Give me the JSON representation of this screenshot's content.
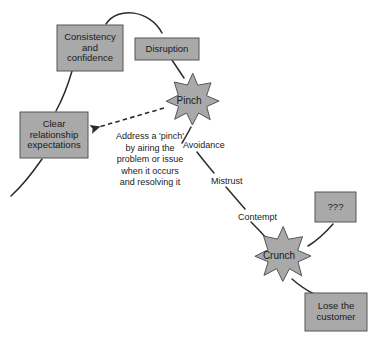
{
  "diagram": {
    "colors": {
      "node_fill": "#a9a9a9",
      "node_stroke": "#555555",
      "line": "#2b2b2b",
      "text": "#1a1a1a",
      "background": "#ffffff"
    },
    "boxes": [
      {
        "id": "consistency",
        "label": "Consistency\nand\nconfidence",
        "x": 57,
        "y": 25,
        "w": 66,
        "h": 46
      },
      {
        "id": "disruption",
        "label": "Disruption",
        "x": 135,
        "y": 38,
        "w": 64,
        "h": 22
      },
      {
        "id": "clear_expectations",
        "label": "Clear\nrelationship\nexpectations",
        "x": 20,
        "y": 112,
        "w": 68,
        "h": 46
      },
      {
        "id": "unknown",
        "label": "???",
        "x": 315,
        "y": 192,
        "w": 41,
        "h": 30
      },
      {
        "id": "lose_customer",
        "label": "Lose the\ncustomer",
        "x": 305,
        "y": 293,
        "w": 62,
        "h": 38
      }
    ],
    "stars": [
      {
        "id": "pinch",
        "label": "Pinch",
        "cx": 189,
        "cy": 101,
        "r_outer": 30,
        "r_inner": 19,
        "points": 11
      },
      {
        "id": "crunch",
        "label": "Crunch",
        "cx": 279,
        "cy": 256,
        "r_outer": 32,
        "r_inner": 20,
        "points": 11
      }
    ],
    "edge_labels": [
      {
        "id": "avoidance",
        "text": "Avoidance",
        "x": 183,
        "y": 140
      },
      {
        "id": "mistrust",
        "text": "Mistrust",
        "x": 211,
        "y": 176
      },
      {
        "id": "contempt",
        "text": "Contempt",
        "x": 238,
        "y": 212
      }
    ],
    "note": {
      "id": "pinch-advice",
      "text": "Address a 'pinch'\nby airing the\nproblem or issue\nwhen it occurs\nand resolving it",
      "x": 98,
      "y": 131,
      "w": 104
    }
  }
}
